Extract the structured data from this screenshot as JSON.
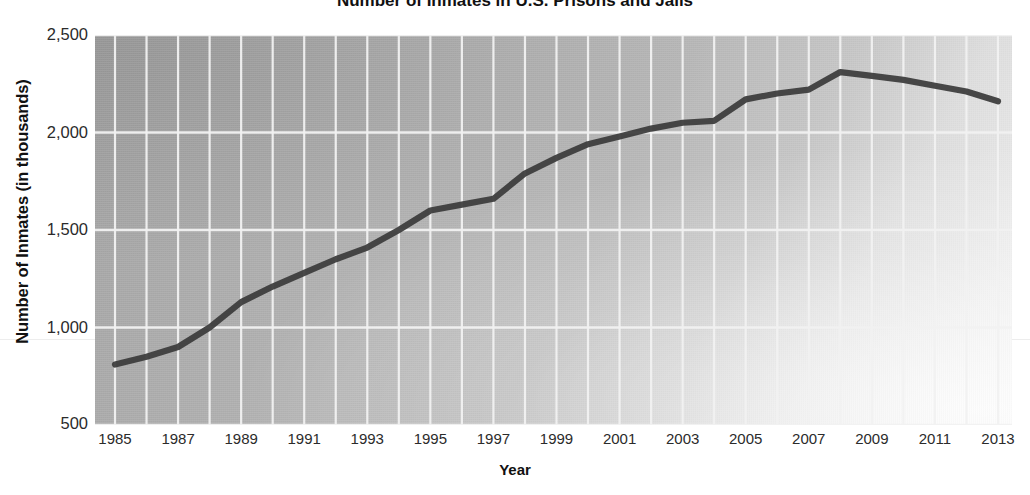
{
  "figure": {
    "title_partial": "Number of Inmates in U.S. Prisons and Jails",
    "ylabel": "Number of Inmates (in thousands)",
    "xlabel": "Year"
  },
  "colors": {
    "line": "#3b3b3b",
    "grid": "#f2f2f2",
    "plot_bg": "#b4b4b4",
    "text": "#2b2b2b"
  },
  "chart_data": {
    "type": "line",
    "title": "Number of Inmates in U.S. Prisons and Jails",
    "xlabel": "Year",
    "ylabel": "Number of Inmates (in thousands)",
    "xlim": [
      1985,
      2013
    ],
    "ylim": [
      500,
      2500
    ],
    "ytick_labels": [
      "2,500",
      "2,000",
      "1,500",
      "1,000",
      "500"
    ],
    "yticks": [
      2500,
      2000,
      1500,
      1000,
      500
    ],
    "xtick_labels": [
      "1985",
      "1987",
      "1989",
      "1991",
      "1993",
      "1995",
      "1997",
      "1999",
      "2001",
      "2003",
      "2005",
      "2007",
      "2009",
      "2011",
      "2013"
    ],
    "xticks": [
      1985,
      1987,
      1989,
      1991,
      1993,
      1995,
      1997,
      1999,
      2001,
      2003,
      2005,
      2007,
      2009,
      2011,
      2013
    ],
    "grid": true,
    "grid_x_every": 1,
    "legend": null,
    "series": [
      {
        "name": "Total inmates",
        "x": [
          1985,
          1986,
          1987,
          1988,
          1989,
          1990,
          1991,
          1992,
          1993,
          1994,
          1995,
          1996,
          1997,
          1998,
          1999,
          2000,
          2001,
          2002,
          2003,
          2004,
          2005,
          2006,
          2007,
          2008,
          2009,
          2010,
          2011,
          2012,
          2013
        ],
        "values": [
          810,
          850,
          900,
          1000,
          1130,
          1210,
          1280,
          1350,
          1410,
          1500,
          1600,
          1630,
          1660,
          1790,
          1870,
          1940,
          1980,
          2020,
          2050,
          2060,
          2170,
          2200,
          2220,
          2310,
          2290,
          2270,
          2240,
          2210,
          2160
        ]
      }
    ]
  }
}
